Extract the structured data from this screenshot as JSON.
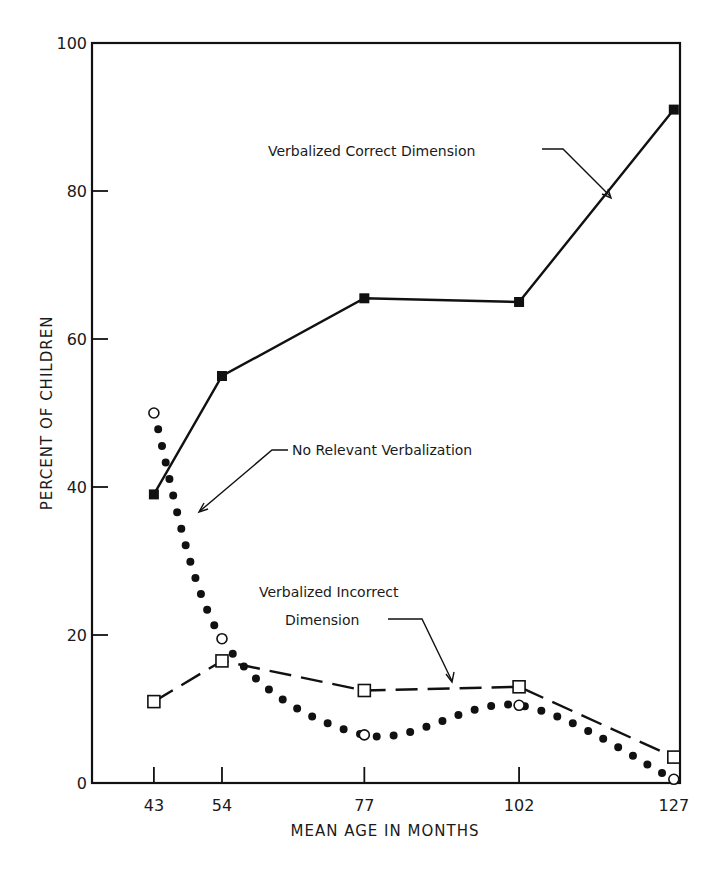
{
  "chart_data": {
    "type": "line",
    "title": "",
    "xlabel": "MEAN AGE IN MONTHS",
    "ylabel": "PERCENT OF CHILDREN",
    "x": [
      43,
      54,
      77,
      102,
      127
    ],
    "x_tick_labels": [
      "43",
      "54",
      "77",
      "102",
      "127"
    ],
    "xlim": [
      33,
      128
    ],
    "ylim": [
      0,
      100
    ],
    "y_ticks": [
      0,
      20,
      40,
      60,
      80,
      100
    ],
    "y_tick_labels": [
      "0",
      "20",
      "40",
      "60",
      "80",
      "100"
    ],
    "grid": false,
    "legend": "none (series labeled by arrow annotations)",
    "series": [
      {
        "name": "Verbalized Correct Dimension",
        "style": "solid line, filled square markers",
        "values": [
          39,
          55,
          65.5,
          65,
          91
        ]
      },
      {
        "name": "No Relevant Verbalization",
        "style": "dotted line, open circle markers",
        "values": [
          50,
          19.5,
          6.5,
          10.5,
          0.5
        ]
      },
      {
        "name": "Verbalized Incorrect Dimension",
        "style": "dashed line, open square markers",
        "values": [
          11,
          16.5,
          12.5,
          13,
          3.5
        ]
      }
    ],
    "annotations": [
      {
        "text": "Verbalized Correct Dimension",
        "points_to": "Verbalized Correct Dimension"
      },
      {
        "text": "No Relevant Verbalization",
        "points_to": "No Relevant Verbalization"
      },
      {
        "text": "Verbalized Incorrect",
        "text2": "Dimension",
        "points_to": "Verbalized Incorrect Dimension"
      }
    ]
  }
}
